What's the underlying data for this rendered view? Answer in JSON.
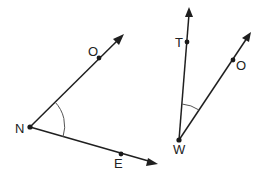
{
  "diagram": {
    "type": "geometry-angles",
    "angles": [
      {
        "name": "angle-ONE",
        "vertex": {
          "label": "N",
          "x": 30,
          "y": 127
        },
        "rays": [
          {
            "point_label": "O",
            "point": {
              "x": 99,
              "y": 58
            },
            "tip": {
              "x": 124,
              "y": 34
            }
          },
          {
            "point_label": "E",
            "point": {
              "x": 121,
              "y": 154
            },
            "tip": {
              "x": 158,
              "y": 164
            }
          }
        ]
      },
      {
        "name": "angle-TWO",
        "vertex": {
          "label": "W",
          "x": 179,
          "y": 140
        },
        "rays": [
          {
            "point_label": "T",
            "point": {
              "x": 187,
              "y": 42
            },
            "tip": {
              "x": 189,
              "y": 8
            }
          },
          {
            "point_label": "O",
            "point": {
              "x": 233,
              "y": 60
            },
            "tip": {
              "x": 251,
              "y": 32
            }
          }
        ]
      }
    ],
    "labels": {
      "N": "N",
      "O_left": "O",
      "E": "E",
      "T": "T",
      "O_right": "O",
      "W": "W"
    },
    "colors": {
      "line": "#1f1f1f",
      "arc": "#555555",
      "text": "#222222",
      "background": "#ffffff"
    }
  }
}
